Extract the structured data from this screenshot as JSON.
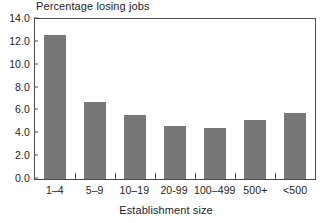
{
  "chart_data": {
    "type": "bar",
    "title": "Percentage losing jobs",
    "xlabel": "Establishment size",
    "ylabel": "",
    "categories": [
      "1–4",
      "5–9",
      "10–19",
      "20-99",
      "100–499",
      "500+",
      "<500"
    ],
    "values": [
      12.6,
      6.7,
      5.6,
      4.6,
      4.5,
      5.2,
      5.8
    ],
    "ylim": [
      0.0,
      14.0
    ],
    "ytick_labels": [
      "14.0",
      "12.0",
      "10.0",
      "8.0",
      "6.0",
      "4.0",
      "2.0",
      "0.0"
    ],
    "ytick_values": [
      14.0,
      12.0,
      10.0,
      8.0,
      6.0,
      4.0,
      2.0,
      0.0
    ],
    "ytick_step": 2.0,
    "grid": false,
    "legend": null,
    "bar_color": "#787878",
    "frame_color": "#4a4a4a",
    "background": "#ffffff"
  }
}
